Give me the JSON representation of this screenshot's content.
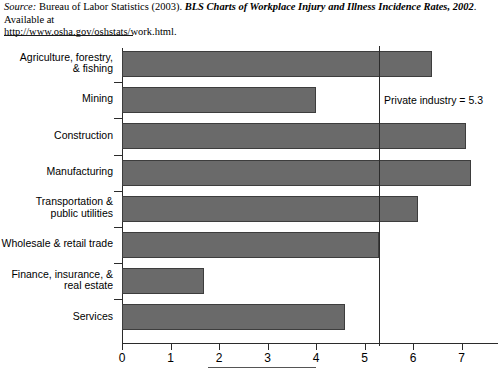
{
  "source": {
    "label": "Source:",
    "agency": " Bureau of Labor Statistics (2003). ",
    "title": "BLS Charts of Workplace Injury and Illness Incidence Rates, 2002",
    "availability": ". Available at",
    "url": "http://www.osha.gov/oshstats/work.html."
  },
  "colors": {
    "bar_fill": "#6a6a6a",
    "bar_border": "#3d3d3d",
    "axis": "#2b2b2b",
    "text": "#000000",
    "background": "#ffffff"
  },
  "annotation": {
    "reference_label": "Private industry = 5.3",
    "reference_value": 5.3
  },
  "chart_data": {
    "type": "bar",
    "orientation": "horizontal",
    "title": "",
    "subtitle": "",
    "xlabel": "",
    "ylabel": "",
    "xlim": [
      0,
      7.6
    ],
    "xticks": [
      0,
      1,
      2,
      3,
      4,
      5,
      6,
      7
    ],
    "xtick_labels": [
      "0",
      "1",
      "2",
      "3",
      "4",
      "5",
      "6",
      "7"
    ],
    "grid": false,
    "legend": false,
    "categories": [
      "Agriculture, forestry,\n& fishing",
      "Mining",
      "Construction",
      "Manufacturing",
      "Transportation &\npublic utilities",
      "Wholesale & retail trade",
      "Finance, insurance, &\nreal estate",
      "Services"
    ],
    "values": [
      6.4,
      4.0,
      7.1,
      7.2,
      6.1,
      5.3,
      1.7,
      4.6
    ],
    "reference_lines": [
      {
        "value": 5.3,
        "label": "Private industry = 5.3"
      }
    ]
  }
}
